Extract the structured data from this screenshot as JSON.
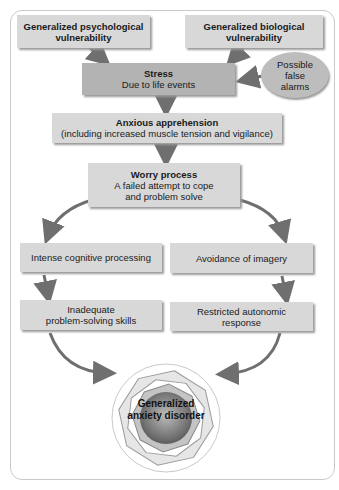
{
  "diagram": {
    "top_left": {
      "line1": "Generalized psychological",
      "line2": "vulnerability"
    },
    "top_right": {
      "line1": "Generalized biological",
      "line2": "vulnerability"
    },
    "stress": {
      "title": "Stress",
      "subtitle": "Due to life events"
    },
    "false_alarms": {
      "line1": "Possible",
      "line2": "false",
      "line3": "alarms"
    },
    "anxious": {
      "title": "Anxious apprehension",
      "subtitle": "(including increased muscle tension and vigilance)"
    },
    "worry": {
      "title": "Worry process",
      "line2": "A failed attempt to cope",
      "line3": "and problem solve"
    },
    "left_branch": {
      "step1": "Intense cognitive processing",
      "step2_line1": "Inadequate",
      "step2_line2": "problem-solving skills"
    },
    "right_branch": {
      "step1": "Avoidance of imagery",
      "step2_line1": "Restricted autonomic",
      "step2_line2": "response"
    },
    "outcome": {
      "line1": "Generalized",
      "line2": "anxiety disorder"
    },
    "colors": {
      "box": "#d8d8d8",
      "stress_box": "#b3b3b3",
      "arrow": "#6f6f6f",
      "frame": "#c9c9c9"
    }
  }
}
